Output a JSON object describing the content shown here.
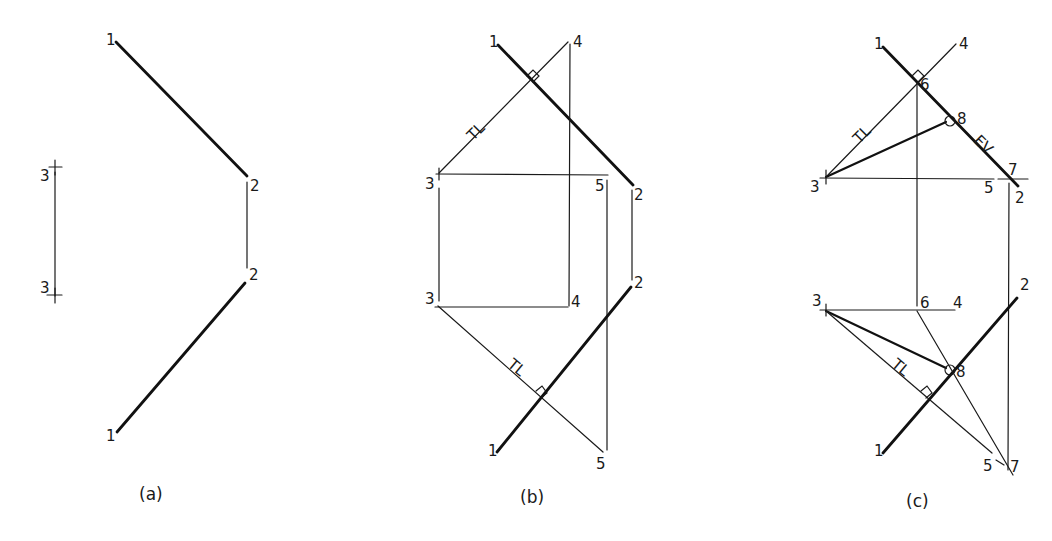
{
  "figure": {
    "panels": [
      {
        "id": "a",
        "caption": "(a)",
        "labels": {
          "p1_top": "1",
          "p2_top": "2",
          "p2_bottom": "2",
          "p1_bottom": "1",
          "p3_top": "3",
          "p3_bottom": "3"
        }
      },
      {
        "id": "b",
        "caption": "(b)",
        "labels": {
          "p1_top": "1",
          "p4_top": "4",
          "tl_top": "TL",
          "p3_top": "3",
          "p5_top": "5",
          "p2_top": "2",
          "p3_bottom": "3",
          "p4_bottom": "4",
          "p2_bottom": "2",
          "tl_bottom": "TL",
          "p1_bottom": "1",
          "p5_bottom": "5"
        }
      },
      {
        "id": "c",
        "caption": "(c)",
        "labels": {
          "p1_top": "1",
          "p4_top": "4",
          "p6_top": "6",
          "p8_top": "8",
          "tl_top": "TL",
          "ev": "EV",
          "p3_top": "3",
          "p5_top": "5",
          "p7_top": "7",
          "p2_top": "2",
          "p3_bottom": "3",
          "p6_bottom": "6",
          "p4_bottom": "4",
          "p2_bottom": "2",
          "p8_bottom": "8",
          "tl_bottom": "TL",
          "p1_bottom": "1",
          "p5_bottom": "5",
          "p7_bottom": "7"
        }
      }
    ]
  }
}
